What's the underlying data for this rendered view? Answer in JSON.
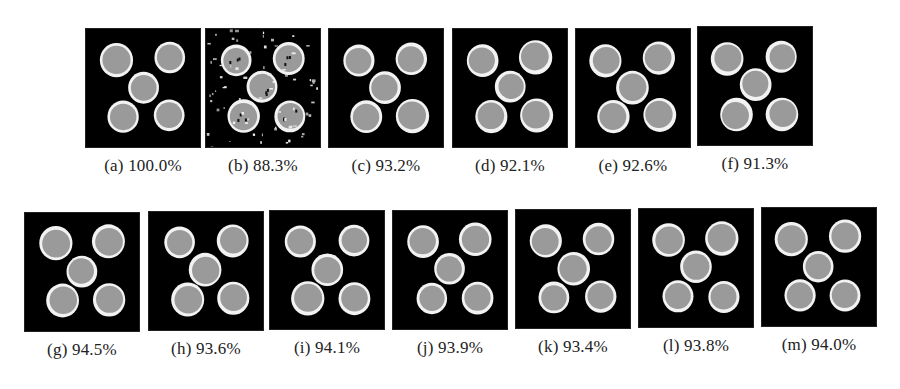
{
  "figure": {
    "row1": [
      {
        "label": "(a)",
        "value": "100.0%",
        "caption": "(a) 100.0%",
        "x": 85,
        "y": 28,
        "noise": 0,
        "rim": 1.0
      },
      {
        "label": "(b)",
        "value": "88.3%",
        "caption": "(b) 88.3%",
        "x": 205,
        "y": 28,
        "noise": 1,
        "rim": 0.8
      },
      {
        "label": "(c)",
        "value": "93.2%",
        "caption": "(c) 93.2%",
        "x": 328,
        "y": 28,
        "noise": 0,
        "rim": 0.6
      },
      {
        "label": "(d)",
        "value": "92.1%",
        "caption": "(d) 92.1%",
        "x": 452,
        "y": 28,
        "noise": 0,
        "rim": 0.5
      },
      {
        "label": "(e)",
        "value": "92.6%",
        "caption": "(e) 92.6%",
        "x": 575,
        "y": 28,
        "noise": 0,
        "rim": 0.6
      },
      {
        "label": "(f)",
        "value": "91.3%",
        "caption": "(f) 91.3%",
        "x": 697,
        "y": 26,
        "noise": 0,
        "rim": 0.4
      }
    ],
    "row2": [
      {
        "label": "(g)",
        "value": "94.5%",
        "caption": "(g) 94.5%",
        "x": 24,
        "y": 212,
        "noise": 0,
        "rim": 0.7
      },
      {
        "label": "(h)",
        "value": "93.6%",
        "caption": "(h) 93.6%",
        "x": 148,
        "y": 211,
        "noise": 0,
        "rim": 0.6
      },
      {
        "label": "(i)",
        "value": "94.1%",
        "caption": "(i) 94.1%",
        "x": 269,
        "y": 210,
        "noise": 0,
        "rim": 0.7
      },
      {
        "label": "(j)",
        "value": "93.9%",
        "caption": "(j) 93.9%",
        "x": 392,
        "y": 210,
        "noise": 0,
        "rim": 0.7
      },
      {
        "label": "(k)",
        "value": "93.4%",
        "caption": "(k) 93.4%",
        "x": 515,
        "y": 209,
        "noise": 0,
        "rim": 0.7
      },
      {
        "label": "(l)",
        "value": "93.8%",
        "caption": "(l) 93.8%",
        "x": 638,
        "y": 208,
        "noise": 0,
        "rim": 0.8
      },
      {
        "label": "(m)",
        "value": "94.0%",
        "caption": "(m) 94.0%",
        "x": 761,
        "y": 207,
        "noise": 0,
        "rim": 0.9
      }
    ]
  },
  "colors": {
    "background": "#000000",
    "ring": "#f2f2f2",
    "core": "#9a9a9a"
  },
  "chart_data": {
    "type": "table",
    "categories": [
      "(a)",
      "(b)",
      "(c)",
      "(d)",
      "(e)",
      "(f)",
      "(g)",
      "(h)",
      "(i)",
      "(j)",
      "(k)",
      "(l)",
      "(m)"
    ],
    "values": [
      100.0,
      88.3,
      93.2,
      92.1,
      92.6,
      91.3,
      94.5,
      93.6,
      94.1,
      93.9,
      93.4,
      93.8,
      94.0
    ]
  }
}
